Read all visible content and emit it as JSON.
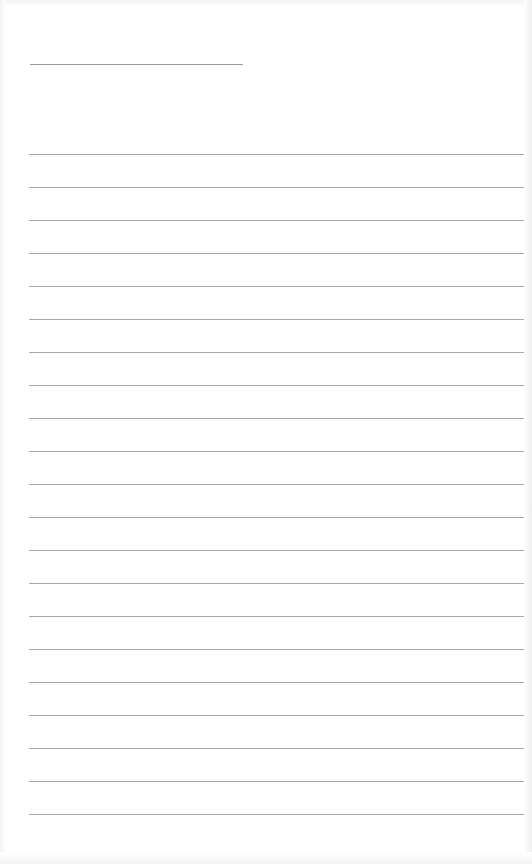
{
  "page": {
    "type": "lined-paper",
    "background": "#ffffff",
    "line_color": "#a8a8a8"
  },
  "header_line": {
    "x": 30,
    "y": 64,
    "width": 213
  },
  "rules": {
    "x": 29,
    "width": 495,
    "start_y": 154,
    "spacing": 33,
    "count": 21
  }
}
